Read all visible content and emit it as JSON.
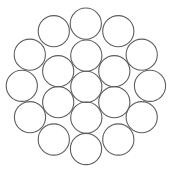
{
  "diagram": {
    "type": "circle-packing",
    "width": 172,
    "height": 173,
    "stroke_color": "#5e5e5e",
    "fill_color": "#ffffff",
    "radius": 15.6,
    "circles": [
      {
        "id": "center",
        "layer": "core",
        "cx": 86.3,
        "cy": 86.8
      },
      {
        "id": "inner-top",
        "layer": "inner",
        "cx": 86.3,
        "cy": 55.6
      },
      {
        "id": "inner-upper-left",
        "layer": "inner",
        "cx": 58.2,
        "cy": 71.2
      },
      {
        "id": "inner-upper-right",
        "layer": "inner",
        "cx": 114.3,
        "cy": 71.2
      },
      {
        "id": "inner-lower-left",
        "layer": "inner",
        "cx": 58.2,
        "cy": 102.2
      },
      {
        "id": "inner-lower-right",
        "layer": "inner",
        "cx": 114.3,
        "cy": 102.2
      },
      {
        "id": "inner-bottom",
        "layer": "inner",
        "cx": 86.3,
        "cy": 117.6
      },
      {
        "id": "outer-top",
        "layer": "outer",
        "cx": 85.8,
        "cy": 23.6
      },
      {
        "id": "outer-top-left",
        "layer": "outer",
        "cx": 53.8,
        "cy": 31.2
      },
      {
        "id": "outer-top-right",
        "layer": "outer",
        "cx": 118.3,
        "cy": 31.2
      },
      {
        "id": "outer-left-upper",
        "layer": "outer",
        "cx": 29.8,
        "cy": 54.7
      },
      {
        "id": "outer-right-upper",
        "layer": "outer",
        "cx": 141.7,
        "cy": 54.7
      },
      {
        "id": "outer-left",
        "layer": "outer",
        "cx": 21.8,
        "cy": 85.8
      },
      {
        "id": "outer-right",
        "layer": "outer",
        "cx": 150.0,
        "cy": 85.8
      },
      {
        "id": "outer-left-lower",
        "layer": "outer",
        "cx": 30.0,
        "cy": 117.2
      },
      {
        "id": "outer-right-lower",
        "layer": "outer",
        "cx": 141.7,
        "cy": 117.2
      },
      {
        "id": "outer-bottom-left",
        "layer": "outer",
        "cx": 53.8,
        "cy": 139.5
      },
      {
        "id": "outer-bottom-right",
        "layer": "outer",
        "cx": 118.3,
        "cy": 139.5
      },
      {
        "id": "outer-bottom",
        "layer": "outer",
        "cx": 86.0,
        "cy": 149.0
      }
    ]
  }
}
